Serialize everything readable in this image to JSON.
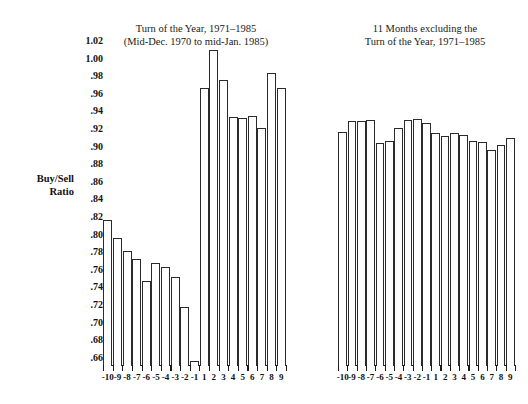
{
  "figure": {
    "left_panel_title": "Turn of the Year, 1971–1985\n(Mid-Dec. 1970 to mid-Jan. 1985)",
    "right_panel_title": "11 Months excluding the\nTurn of the Year, 1971–1985",
    "y_axis_label": "Buy/Sell\nRatio"
  },
  "chart_data": [
    {
      "type": "bar",
      "title": "Turn of the Year, 1971–1985 (Mid-Dec. 1970 to mid-Jan. 1985)",
      "xlabel": "",
      "ylabel": "Buy/Sell Ratio",
      "ylim": [
        0.65,
        1.025
      ],
      "yticks": [
        0.66,
        0.68,
        0.7,
        0.72,
        0.74,
        0.76,
        0.78,
        0.8,
        0.82,
        0.84,
        0.86,
        0.88,
        0.9,
        0.92,
        0.94,
        0.96,
        0.98,
        1.0,
        1.02
      ],
      "ytick_labels": [
        ".66",
        ".68",
        ".70",
        ".72",
        ".74",
        ".76",
        ".78",
        ".80",
        ".82",
        ".84",
        ".86",
        ".88",
        ".90",
        ".92",
        ".94",
        ".96",
        ".98",
        "1.00",
        "1.02"
      ],
      "grid": false,
      "legend": "none",
      "categories": [
        "-10",
        "-9",
        "-8",
        "-7",
        "-6",
        "-5",
        "-4",
        "-3",
        "-2",
        "-1",
        "1",
        "2",
        "3",
        "4",
        "5",
        "6",
        "7",
        "8",
        "9"
      ],
      "values": [
        0.816,
        0.796,
        0.781,
        0.772,
        0.747,
        0.767,
        0.763,
        0.751,
        0.717,
        0.656,
        0.966,
        1.009,
        0.975,
        0.933,
        0.932,
        0.934,
        0.921,
        0.983,
        0.966
      ]
    },
    {
      "type": "bar",
      "title": "11 Months excluding the Turn of the Year, 1971–1985",
      "xlabel": "",
      "ylabel": "Buy/Sell Ratio",
      "ylim": [
        0.65,
        1.025
      ],
      "yticks": [
        0.66,
        0.68,
        0.7,
        0.72,
        0.74,
        0.76,
        0.78,
        0.8,
        0.82,
        0.84,
        0.86,
        0.88,
        0.9,
        0.92,
        0.94,
        0.96,
        0.98,
        1.0,
        1.02
      ],
      "grid": false,
      "legend": "none",
      "categories": [
        "-10",
        "-9",
        "-8",
        "-7",
        "-6",
        "-5",
        "-4",
        "-3",
        "-2",
        "-1",
        "1",
        "2",
        "3",
        "4",
        "5",
        "6",
        "7",
        "8",
        "9"
      ],
      "values": [
        0.916,
        0.928,
        0.928,
        0.93,
        0.903,
        0.906,
        0.921,
        0.929,
        0.931,
        0.926,
        0.915,
        0.911,
        0.915,
        0.913,
        0.906,
        0.905,
        0.896,
        0.901,
        0.909
      ]
    }
  ],
  "style": {
    "bar_edge_color": "#2b2b2b",
    "bar_fill_color": "#ffffff",
    "axis_color": "#1a1a1a",
    "text_color": "#111111",
    "background": "#ffffff"
  }
}
